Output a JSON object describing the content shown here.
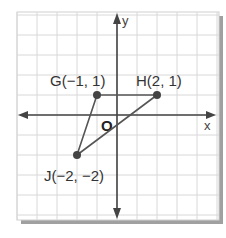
{
  "diagram": {
    "type": "coordinate-plane",
    "grid": {
      "x_min": -5,
      "x_max": 5,
      "y_min": -5,
      "y_max": 5,
      "unit_px": 20
    },
    "axes": {
      "x_label": "x",
      "y_label": "y",
      "origin_label": "O"
    },
    "points": [
      {
        "name": "G",
        "x": -1,
        "y": 1,
        "label": "G(−1, 1)"
      },
      {
        "name": "H",
        "x": 2,
        "y": 1,
        "label": "H(2, 1)"
      },
      {
        "name": "J",
        "x": -2,
        "y": -2,
        "label": "J(−2, −2)"
      }
    ],
    "segments": [
      [
        "G",
        "H"
      ],
      [
        "H",
        "J"
      ],
      [
        "J",
        "G"
      ]
    ],
    "colors": {
      "grid": "#d8d8d8",
      "axis": "#444444",
      "triangle": "#555555",
      "point": "#444444",
      "shadow": "#9a9a9a",
      "paper": "#ffffff"
    }
  }
}
